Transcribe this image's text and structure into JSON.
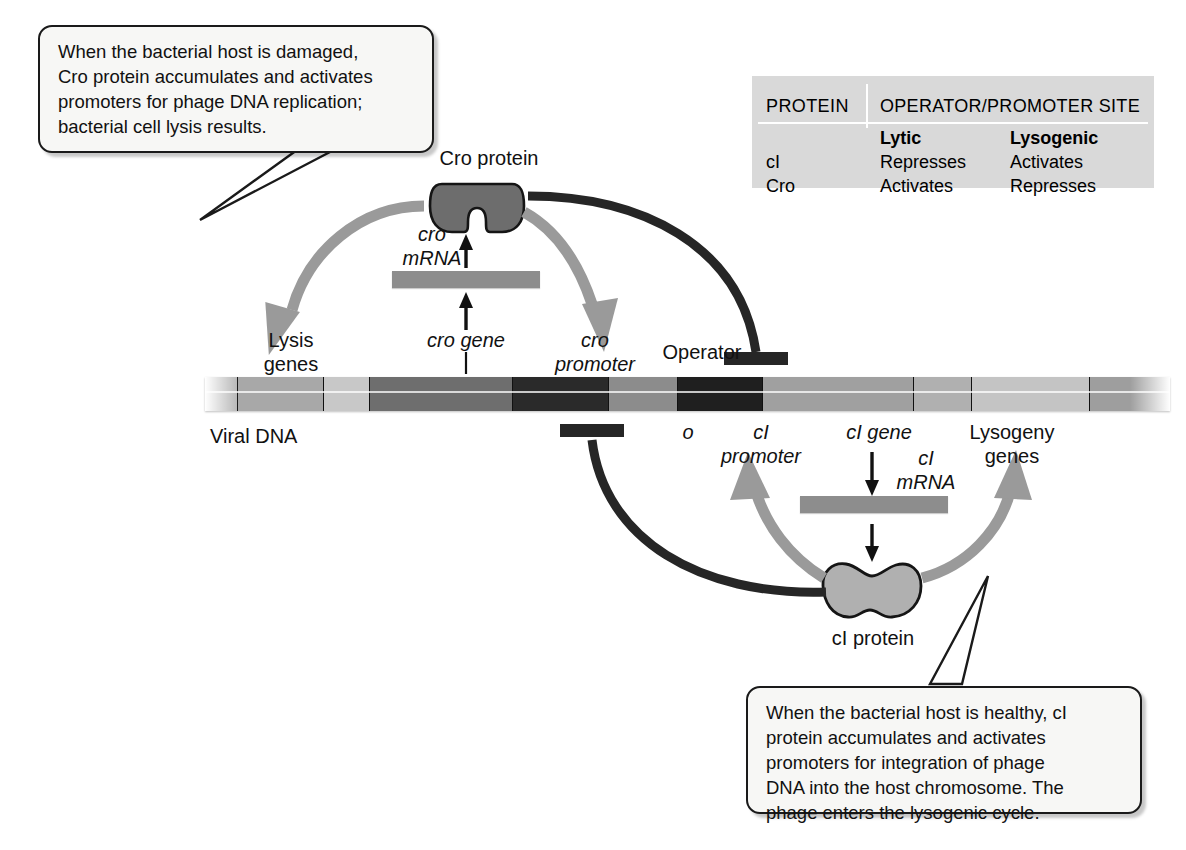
{
  "callouts": {
    "top": "When the bacterial host is damaged,\nCro protein accumulates and activates\npromoters for phage DNA replication;\nbacterial cell lysis results.",
    "bottom": "When the bacterial host is healthy, cI\nprotein accumulates and activates\npromoters for integration of phage\nDNA into the host chromosome. The\nphage enters the lysogenic cycle."
  },
  "table": {
    "header_protein": "PROTEIN",
    "header_site": "OPERATOR/PROMOTER SITE",
    "subheader_lytic": "Lytic",
    "subheader_lysogenic": "Lysogenic",
    "rows": [
      {
        "protein": "cI",
        "lytic": "Represses",
        "lysogenic": "Activates"
      },
      {
        "protein": "Cro",
        "lytic": "Activates",
        "lysogenic": "Represses"
      }
    ]
  },
  "labels": {
    "viral_dna": "Viral DNA",
    "cro_protein": "Cro protein",
    "ci_protein": "cI protein",
    "cro_mrna": "cro\nmRNA",
    "ci_mrna": "cI\nmRNA",
    "lysis_genes": "Lysis\ngenes",
    "cro_gene": "cro gene",
    "cro_promoter": "cro\npromoter",
    "operator": "Operator",
    "operator_o": "o",
    "ci_promoter": "cI\npromoter",
    "ci_gene": "cI gene",
    "lysogeny_genes": "Lysogeny\ngenes"
  },
  "dna_segments": [
    {
      "name": "left-flank",
      "width": 32,
      "color": "#b4b4b4"
    },
    {
      "name": "lysis-genes",
      "width": 86,
      "color": "#a8a8a8"
    },
    {
      "name": "spacer-1",
      "width": 46,
      "color": "#c8c8c8"
    },
    {
      "name": "cro-gene",
      "width": 143,
      "color": "#6e6e6e"
    },
    {
      "name": "cro-promoter",
      "width": 96,
      "color": "#2a2a2a"
    },
    {
      "name": "operator",
      "width": 69,
      "color": "#8c8c8c"
    },
    {
      "name": "ci-promoter",
      "width": 85,
      "color": "#1f1f1f"
    },
    {
      "name": "ci-gene",
      "width": 151,
      "color": "#a0a0a0"
    },
    {
      "name": "spacer-2",
      "width": 58,
      "color": "#b0b0b0"
    },
    {
      "name": "lysogeny-genes",
      "width": 118,
      "color": "#c4c4c4"
    },
    {
      "name": "right-flank",
      "width": 81,
      "color": "#9e9e9e"
    }
  ],
  "colors": {
    "cro_protein_fill": "#6d6d6d",
    "ci_protein_fill": "#b0b0b0",
    "activation_arrow": "#9a9a9a",
    "repression_line": "#262626",
    "mrna_bar": "#8d8d8d",
    "table_background": "#d9d9d9",
    "callout_background": "#f7f7f5"
  },
  "chart_data": {
    "type": "diagram",
    "nodes": [
      "cro gene",
      "cro mRNA",
      "Cro protein",
      "cI gene",
      "cI mRNA",
      "cI protein",
      "Lysis genes",
      "Lysogeny genes",
      "cro promoter",
      "Operator",
      "cI promoter"
    ],
    "edges": [
      {
        "from": "cro gene",
        "to": "cro mRNA",
        "type": "transcription"
      },
      {
        "from": "cro mRNA",
        "to": "Cro protein",
        "type": "translation"
      },
      {
        "from": "Cro protein",
        "to": "Lysis genes",
        "type": "activates"
      },
      {
        "from": "Cro protein",
        "to": "cro promoter",
        "type": "activates"
      },
      {
        "from": "Cro protein",
        "to": "cI promoter",
        "type": "represses"
      },
      {
        "from": "cI gene",
        "to": "cI mRNA",
        "type": "transcription"
      },
      {
        "from": "cI mRNA",
        "to": "cI protein",
        "type": "translation"
      },
      {
        "from": "cI protein",
        "to": "cI promoter",
        "type": "activates"
      },
      {
        "from": "cI protein",
        "to": "Lysogeny genes",
        "type": "activates"
      },
      {
        "from": "cI protein",
        "to": "cro promoter",
        "type": "represses"
      }
    ]
  }
}
